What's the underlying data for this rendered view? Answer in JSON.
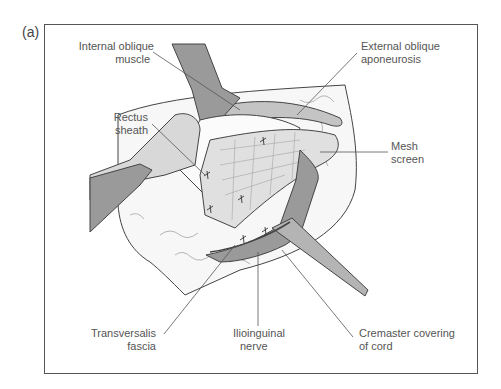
{
  "figure": {
    "panel_label": "(a)",
    "labels": {
      "internal_oblique_1": "Internal oblique",
      "internal_oblique_2": "muscle",
      "external_oblique_1": "External oblique",
      "external_oblique_2": "aponeurosis",
      "rectus_1": "Rectus",
      "rectus_2": "sheath",
      "mesh_1": "Mesh",
      "mesh_2": "screen",
      "transversalis_1": "Transversalis",
      "transversalis_2": "fascia",
      "ilioinguinal_1": "Ilioinguinal",
      "ilioinguinal_2": "nerve",
      "cremaster_1": "Cremaster covering",
      "cremaster_2": "of cord"
    },
    "colors": {
      "dark_tissue": "#9a9a9a",
      "mid_tissue": "#c4c4c4",
      "light_tissue": "#e2e2e2",
      "outline": "#444444"
    }
  }
}
